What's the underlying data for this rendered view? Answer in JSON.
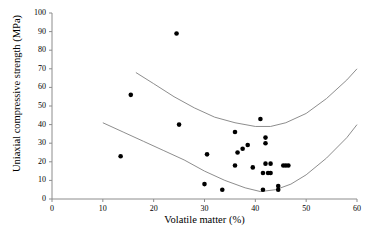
{
  "chart_data": {
    "type": "scatter",
    "title": "",
    "xlabel": "Volatile matter (%)",
    "ylabel": "Uniaxial compressive strength (MPa)",
    "xlim": [
      0,
      60
    ],
    "ylim": [
      0,
      100
    ],
    "xticks": [
      0,
      10,
      20,
      30,
      40,
      50,
      60
    ],
    "yticks": [
      0,
      10,
      20,
      30,
      40,
      50,
      60,
      70,
      80,
      90,
      100
    ],
    "grid": false,
    "legend": false,
    "marker": "filled-circle",
    "marker_color": "#000000",
    "curve_color": "#808080",
    "points": [
      {
        "x": 13.5,
        "y": 23
      },
      {
        "x": 15.5,
        "y": 56
      },
      {
        "x": 24.5,
        "y": 89
      },
      {
        "x": 25.0,
        "y": 40
      },
      {
        "x": 30.5,
        "y": 24
      },
      {
        "x": 30.0,
        "y": 8
      },
      {
        "x": 33.5,
        "y": 5
      },
      {
        "x": 36.0,
        "y": 36
      },
      {
        "x": 37.5,
        "y": 27
      },
      {
        "x": 36.5,
        "y": 25
      },
      {
        "x": 38.5,
        "y": 29
      },
      {
        "x": 36.0,
        "y": 18
      },
      {
        "x": 39.5,
        "y": 17
      },
      {
        "x": 41.0,
        "y": 43
      },
      {
        "x": 42.0,
        "y": 33
      },
      {
        "x": 42.0,
        "y": 30
      },
      {
        "x": 41.5,
        "y": 14
      },
      {
        "x": 42.5,
        "y": 14
      },
      {
        "x": 43.0,
        "y": 14
      },
      {
        "x": 42.0,
        "y": 19
      },
      {
        "x": 43.0,
        "y": 19
      },
      {
        "x": 41.5,
        "y": 5
      },
      {
        "x": 44.5,
        "y": 5
      },
      {
        "x": 44.5,
        "y": 7
      },
      {
        "x": 45.5,
        "y": 18
      },
      {
        "x": 46.0,
        "y": 18
      },
      {
        "x": 46.5,
        "y": 18
      }
    ],
    "envelope_curves": [
      {
        "name": "upper-bound-curve",
        "points": [
          {
            "x": 16.5,
            "y": 68
          },
          {
            "x": 20.0,
            "y": 62
          },
          {
            "x": 24.0,
            "y": 55
          },
          {
            "x": 28.0,
            "y": 49
          },
          {
            "x": 32.0,
            "y": 44
          },
          {
            "x": 36.0,
            "y": 41
          },
          {
            "x": 40.0,
            "y": 39
          },
          {
            "x": 43.0,
            "y": 39
          },
          {
            "x": 46.0,
            "y": 41
          },
          {
            "x": 50.0,
            "y": 46
          },
          {
            "x": 54.0,
            "y": 54
          },
          {
            "x": 58.0,
            "y": 64
          },
          {
            "x": 60.0,
            "y": 70
          }
        ]
      },
      {
        "name": "lower-bound-curve",
        "points": [
          {
            "x": 10.0,
            "y": 41
          },
          {
            "x": 14.0,
            "y": 36
          },
          {
            "x": 18.0,
            "y": 31
          },
          {
            "x": 22.0,
            "y": 26
          },
          {
            "x": 26.0,
            "y": 21
          },
          {
            "x": 30.0,
            "y": 15
          },
          {
            "x": 34.0,
            "y": 10
          },
          {
            "x": 38.0,
            "y": 6
          },
          {
            "x": 41.0,
            "y": 4
          },
          {
            "x": 44.0,
            "y": 5
          },
          {
            "x": 47.0,
            "y": 8
          },
          {
            "x": 50.0,
            "y": 13
          },
          {
            "x": 54.0,
            "y": 22
          },
          {
            "x": 58.0,
            "y": 33
          },
          {
            "x": 60.0,
            "y": 40
          }
        ]
      }
    ]
  }
}
